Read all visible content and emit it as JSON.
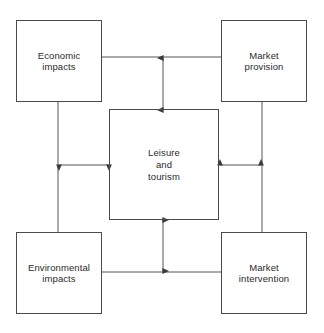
{
  "diagram": {
    "type": "concept-relationship-diagram",
    "background_color": "#ffffff",
    "stroke_color": "#4a4a4a",
    "text_color": "#2b2b2b",
    "center": {
      "id": "leisure-and-tourism",
      "label": "Leisure\nand\ntourism"
    },
    "nodes": [
      {
        "id": "economic-impacts",
        "label": "Economic\nimpacts",
        "position": "top-left"
      },
      {
        "id": "market-provision",
        "label": "Market\nprovision",
        "position": "top-right"
      },
      {
        "id": "environmental-impacts",
        "label": "Environmental\nimpacts",
        "position": "bottom-left"
      },
      {
        "id": "market-intervention",
        "label": "Market\nintervention",
        "position": "bottom-right"
      }
    ],
    "connectors": {
      "ring_lines": [
        "economic-impacts-to-market-provision",
        "economic-impacts-to-environmental-impacts",
        "market-provision-to-market-intervention",
        "environmental-impacts-to-market-intervention"
      ],
      "arrows": [
        {
          "id": "top-arrow",
          "direction": "double",
          "orientation": "vertical",
          "from": "top-ring-line",
          "to": "leisure-and-tourism"
        },
        {
          "id": "left-arrow",
          "direction": "double",
          "orientation": "horizontal",
          "from": "left-ring-line",
          "to": "leisure-and-tourism"
        },
        {
          "id": "right-arrow",
          "direction": "double",
          "orientation": "horizontal",
          "from": "right-ring-line",
          "to": "leisure-and-tourism"
        },
        {
          "id": "bottom-arrow",
          "direction": "double",
          "orientation": "vertical",
          "from": "bottom-ring-line",
          "to": "leisure-and-tourism"
        }
      ]
    }
  }
}
